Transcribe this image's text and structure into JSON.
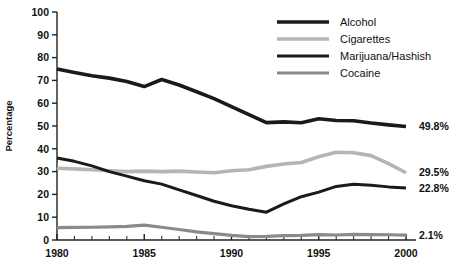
{
  "chart_data": {
    "type": "line",
    "title": "",
    "xlabel": "",
    "ylabel": "Percentage",
    "xlim": [
      1980,
      2000
    ],
    "ylim": [
      0,
      100
    ],
    "grid": false,
    "legend_position": "top-right",
    "x_tick_labels": [
      "1980",
      "1985",
      "1990",
      "1995",
      "2000"
    ],
    "x_ticks": [
      1980,
      1985,
      1990,
      1995,
      2000
    ],
    "x_minor_ticks": [
      1981,
      1982,
      1983,
      1984,
      1986,
      1987,
      1988,
      1989,
      1991,
      1992,
      1993,
      1994,
      1996,
      1997,
      1998,
      1999
    ],
    "y_tick_labels": [
      "0",
      "10",
      "20",
      "30",
      "40",
      "50",
      "60",
      "70",
      "80",
      "90",
      "100"
    ],
    "y_ticks": [
      0,
      10,
      20,
      30,
      40,
      50,
      60,
      70,
      80,
      90,
      100
    ],
    "x": [
      1980,
      1981,
      1982,
      1983,
      1984,
      1985,
      1986,
      1987,
      1988,
      1989,
      1990,
      1991,
      1992,
      1993,
      1994,
      1995,
      1996,
      1997,
      1998,
      1999,
      2000
    ],
    "series": [
      {
        "name": "Alcohol",
        "color": "#1a1a1a",
        "width": 3.6,
        "end_label": "49.8%",
        "end_value": 49.8,
        "values": [
          75.0,
          73.5,
          72.0,
          71.0,
          69.5,
          67.3,
          70.4,
          68.0,
          65.0,
          62.0,
          58.5,
          55.0,
          51.5,
          51.8,
          51.4,
          53.2,
          52.4,
          52.3,
          51.3,
          50.5,
          49.8
        ]
      },
      {
        "name": "Cigarettes",
        "color": "#b5b5b5",
        "width": 3.6,
        "end_label": "29.5%",
        "end_value": 29.5,
        "values": [
          31.5,
          31.2,
          30.8,
          30.4,
          30.0,
          30.2,
          30.0,
          30.2,
          29.8,
          29.5,
          30.4,
          30.8,
          32.3,
          33.3,
          34.0,
          36.5,
          38.5,
          38.3,
          37.0,
          33.5,
          29.5
        ]
      },
      {
        "name": "Marijuana/Hashish",
        "color": "#1a1a1a",
        "width": 3.0,
        "end_label": "22.8%",
        "end_value": 22.8,
        "values": [
          36.0,
          34.5,
          32.5,
          30.0,
          28.0,
          26.0,
          24.5,
          22.0,
          19.5,
          17.0,
          15.0,
          13.5,
          12.2,
          15.8,
          19.0,
          21.0,
          23.5,
          24.5,
          24.0,
          23.3,
          22.8
        ]
      },
      {
        "name": "Cocaine",
        "color": "#8a8a8a",
        "width": 3.2,
        "end_label": "2.1%",
        "end_value": 2.1,
        "values": [
          5.4,
          5.5,
          5.6,
          5.8,
          6.0,
          6.5,
          5.6,
          4.6,
          3.6,
          2.8,
          2.0,
          1.5,
          1.6,
          1.9,
          2.0,
          2.4,
          2.2,
          2.5,
          2.4,
          2.3,
          2.1
        ]
      }
    ]
  },
  "legend": {
    "items": [
      {
        "label": "Alcohol"
      },
      {
        "label": "Cigarettes"
      },
      {
        "label": "Marijuana/Hashish"
      },
      {
        "label": "Cocaine"
      }
    ]
  },
  "axis": {
    "y_title": "Percentage"
  }
}
